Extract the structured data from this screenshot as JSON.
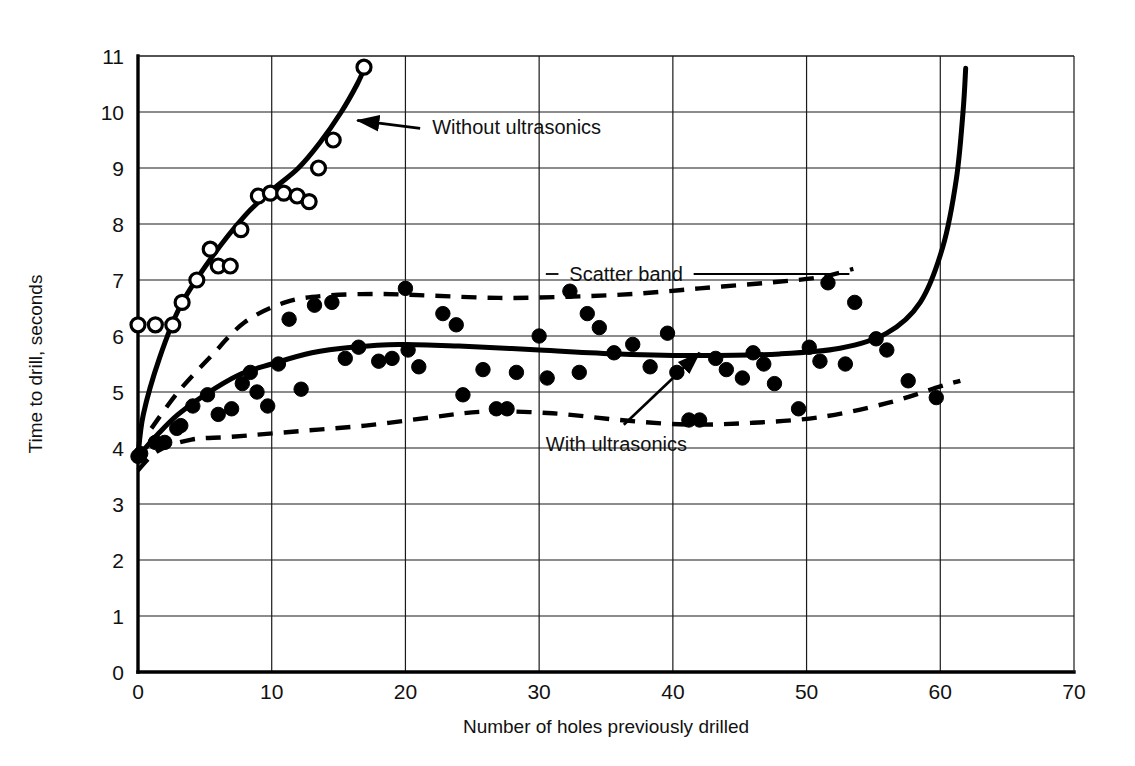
{
  "chart_data": {
    "type": "scatter",
    "title": "",
    "xlabel": "Number of holes previously drilled",
    "ylabel": "Time to drill, seconds",
    "xlim": [
      0,
      70
    ],
    "ylim": [
      0,
      11
    ],
    "xticks": [
      0,
      10,
      20,
      30,
      40,
      50,
      60,
      70
    ],
    "yticks": [
      0,
      1,
      2,
      3,
      4,
      5,
      6,
      7,
      8,
      9,
      10,
      11
    ],
    "grid": true,
    "legend_position": "inline-annotations",
    "annotations": [
      {
        "id": "without-ultrasonics",
        "text": "Without ultrasonics",
        "x": 22.0,
        "y": 9.6,
        "points_to_x": 16.4,
        "points_to_y": 9.85
      },
      {
        "id": "scatter-band",
        "text": "Scatter band",
        "x": 36.5,
        "y": 7.0,
        "leader_left_x": 30.5,
        "leader_right_x": 53.2
      },
      {
        "id": "with-ultrasonics",
        "text": "With ultrasonics",
        "x": 30.5,
        "y": 3.95,
        "points_to_x": 42.0,
        "points_to_y": 5.7
      }
    ],
    "series": [
      {
        "name": "Without ultrasonics",
        "marker": "open-circle",
        "points": [
          [
            0.0,
            6.2
          ],
          [
            1.3,
            6.2
          ],
          [
            2.6,
            6.2
          ],
          [
            3.3,
            6.6
          ],
          [
            4.4,
            7.0
          ],
          [
            6.0,
            7.25
          ],
          [
            6.9,
            7.25
          ],
          [
            5.4,
            7.55
          ],
          [
            7.7,
            7.9
          ],
          [
            9.0,
            8.5
          ],
          [
            9.9,
            8.55
          ],
          [
            10.9,
            8.55
          ],
          [
            11.9,
            8.5
          ],
          [
            12.8,
            8.4
          ],
          [
            13.5,
            9.0
          ],
          [
            14.6,
            9.5
          ],
          [
            16.9,
            10.8
          ]
        ],
        "fit_curve": [
          [
            0.0,
            3.85
          ],
          [
            0.4,
            4.6
          ],
          [
            1.6,
            5.6
          ],
          [
            3.2,
            6.55
          ],
          [
            5.5,
            7.4
          ],
          [
            8.0,
            8.15
          ],
          [
            10.0,
            8.6
          ],
          [
            12.0,
            9.0
          ],
          [
            13.6,
            9.45
          ],
          [
            15.2,
            10.0
          ],
          [
            16.4,
            10.5
          ],
          [
            17.0,
            10.82
          ]
        ]
      },
      {
        "name": "With ultrasonics",
        "marker": "filled-circle",
        "points": [
          [
            0.0,
            3.85
          ],
          [
            0.2,
            3.9
          ],
          [
            1.3,
            4.1
          ],
          [
            2.0,
            4.1
          ],
          [
            2.9,
            4.35
          ],
          [
            3.2,
            4.4
          ],
          [
            4.1,
            4.75
          ],
          [
            5.2,
            4.95
          ],
          [
            6.0,
            4.6
          ],
          [
            7.0,
            4.7
          ],
          [
            7.8,
            5.15
          ],
          [
            8.4,
            5.35
          ],
          [
            8.9,
            5.0
          ],
          [
            9.7,
            4.75
          ],
          [
            10.5,
            5.5
          ],
          [
            11.3,
            6.3
          ],
          [
            12.2,
            5.05
          ],
          [
            13.2,
            6.55
          ],
          [
            14.5,
            6.6
          ],
          [
            15.5,
            5.6
          ],
          [
            16.5,
            5.8
          ],
          [
            18.0,
            5.55
          ],
          [
            19.0,
            5.6
          ],
          [
            20.0,
            6.85
          ],
          [
            20.2,
            5.75
          ],
          [
            21.0,
            5.45
          ],
          [
            22.8,
            6.4
          ],
          [
            23.8,
            6.2
          ],
          [
            24.3,
            4.95
          ],
          [
            25.8,
            5.4
          ],
          [
            26.8,
            4.7
          ],
          [
            27.6,
            4.7
          ],
          [
            28.3,
            5.35
          ],
          [
            30.0,
            6.0
          ],
          [
            30.6,
            5.25
          ],
          [
            32.3,
            6.8
          ],
          [
            33.0,
            5.35
          ],
          [
            33.6,
            6.4
          ],
          [
            34.5,
            6.15
          ],
          [
            35.6,
            5.7
          ],
          [
            37.0,
            5.85
          ],
          [
            38.3,
            5.45
          ],
          [
            39.6,
            6.05
          ],
          [
            40.3,
            5.35
          ],
          [
            41.2,
            4.5
          ],
          [
            42.0,
            4.5
          ],
          [
            43.2,
            5.6
          ],
          [
            44.0,
            5.4
          ],
          [
            45.2,
            5.25
          ],
          [
            46.0,
            5.7
          ],
          [
            46.8,
            5.5
          ],
          [
            47.6,
            5.15
          ],
          [
            49.4,
            4.7
          ],
          [
            50.2,
            5.8
          ],
          [
            51.0,
            5.55
          ],
          [
            51.6,
            6.95
          ],
          [
            52.9,
            5.5
          ],
          [
            53.6,
            6.6
          ],
          [
            55.2,
            5.95
          ],
          [
            56.0,
            5.75
          ],
          [
            57.6,
            5.2
          ],
          [
            59.7,
            4.9
          ]
        ],
        "fit_curve": [
          [
            0.0,
            3.85
          ],
          [
            1.5,
            4.25
          ],
          [
            3.0,
            4.6
          ],
          [
            5.0,
            4.95
          ],
          [
            7.5,
            5.3
          ],
          [
            10.0,
            5.5
          ],
          [
            13.0,
            5.7
          ],
          [
            16.0,
            5.8
          ],
          [
            19.5,
            5.85
          ],
          [
            24.0,
            5.82
          ],
          [
            30.0,
            5.75
          ],
          [
            36.0,
            5.68
          ],
          [
            42.0,
            5.65
          ],
          [
            48.0,
            5.68
          ],
          [
            52.5,
            5.78
          ],
          [
            56.0,
            6.05
          ],
          [
            58.5,
            6.6
          ],
          [
            60.2,
            7.6
          ],
          [
            61.2,
            8.8
          ],
          [
            61.7,
            10.0
          ],
          [
            61.9,
            10.78
          ]
        ]
      }
    ],
    "scatter_band": {
      "upper": [
        [
          1.0,
          4.35
        ],
        [
          3.0,
          5.0
        ],
        [
          5.5,
          5.65
        ],
        [
          8.0,
          6.25
        ],
        [
          11.0,
          6.6
        ],
        [
          14.0,
          6.72
        ],
        [
          18.0,
          6.75
        ],
        [
          22.0,
          6.72
        ],
        [
          27.0,
          6.68
        ],
        [
          32.0,
          6.7
        ],
        [
          37.0,
          6.75
        ],
        [
          42.0,
          6.85
        ],
        [
          47.0,
          6.95
        ],
        [
          51.0,
          7.05
        ],
        [
          53.5,
          7.2
        ]
      ],
      "lower": [
        [
          0.0,
          3.6
        ],
        [
          1.5,
          3.95
        ],
        [
          4.0,
          4.15
        ],
        [
          7.0,
          4.2
        ],
        [
          12.0,
          4.3
        ],
        [
          17.0,
          4.4
        ],
        [
          22.0,
          4.55
        ],
        [
          26.0,
          4.65
        ],
        [
          31.0,
          4.62
        ],
        [
          36.0,
          4.5
        ],
        [
          41.0,
          4.42
        ],
        [
          46.0,
          4.45
        ],
        [
          51.0,
          4.55
        ],
        [
          56.0,
          4.8
        ],
        [
          60.0,
          5.1
        ],
        [
          61.5,
          5.2
        ]
      ]
    }
  },
  "figure": {
    "background_color": "#ffffff",
    "ink_color": "#000000",
    "plot_left_px": 138,
    "plot_right_px": 1074,
    "plot_top_px": 56,
    "plot_bottom_px": 672
  }
}
